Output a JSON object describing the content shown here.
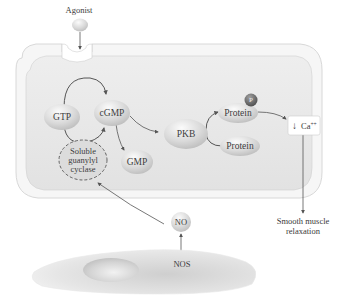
{
  "figure": {
    "type": "signaling-pathway-diagram",
    "title": "",
    "colors": {
      "cell_fill": "#e6e6e6",
      "cell_border": "#ffffff",
      "node_fill": "#d9d9d9",
      "node_highlight": "#fbfbfb",
      "phosphate_fill": "#6d6d6d",
      "arrow": "#555555",
      "text": "#3a3a3a"
    }
  },
  "labels": {
    "agonist": "Agonist",
    "gtp": "GTP",
    "cgmp": "cGMP",
    "soluble_gc_line1": "Soluble",
    "soluble_gc_line2": "guanylyl",
    "soluble_gc_line3": "cyclase",
    "gmp": "GMP",
    "pkb": "PKB",
    "protein_phosphorylated": "Protein",
    "protein_unphosphorylated": "Protein",
    "phosphate": "P",
    "calcium_arrow": "↓",
    "calcium": "Ca",
    "calcium_charge": "++",
    "outcome_line1": "Smooth muscle",
    "outcome_line2": "relaxation",
    "no": "NO",
    "nos": "NOS"
  },
  "edges": [
    {
      "from": "agonist",
      "to": "receptor"
    },
    {
      "from": "gtp",
      "to": "cgmp",
      "via": "soluble_gc"
    },
    {
      "from": "cgmp",
      "to": "gmp"
    },
    {
      "from": "cgmp",
      "to": "pkb"
    },
    {
      "from": "pkb",
      "to": "protein_phosphorylated",
      "from_substrate": "protein_unphosphorylated"
    },
    {
      "from": "protein_phosphorylated",
      "to": "calcium_decrease"
    },
    {
      "from": "calcium_decrease",
      "to": "smooth_muscle_relaxation"
    },
    {
      "from": "nos",
      "to": "no"
    },
    {
      "from": "no",
      "to": "soluble_gc"
    }
  ]
}
